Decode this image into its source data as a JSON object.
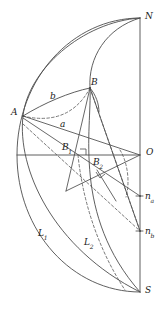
{
  "figure": {
    "type": "geometric-diagram",
    "background_color": "#ffffff",
    "stroke_color": "#4d4d4d",
    "label_color": "#1a1a1a"
  },
  "labels": {
    "north_pole": "N",
    "south_pole": "S",
    "center": "O",
    "point_a": "A",
    "point_b": "B",
    "arc_b": "b",
    "arc_a": "a",
    "angle_b1": "B",
    "angle_b1_sub": "1",
    "angle_b2": "B",
    "angle_b2_sub": "2",
    "normal_a": "n",
    "normal_a_sub": "a",
    "normal_b": "n",
    "normal_b_sub": "b",
    "curve_l1": "L",
    "curve_l1_sub": "1",
    "curve_l2": "L",
    "curve_l2_sub": "2"
  },
  "geometry": {
    "north_pole_point": [
      140,
      18
    ],
    "south_pole_point": [
      140,
      292
    ],
    "center_point": [
      140,
      155
    ],
    "point_a": [
      23,
      116
    ],
    "point_b": [
      90,
      88
    ],
    "point_b1": [
      78,
      155
    ],
    "point_b2": [
      97,
      170
    ],
    "normal_a_point": [
      140,
      196
    ],
    "normal_b_point": [
      140,
      231
    ],
    "sphere_left_extent": 17,
    "equator_y": 155
  },
  "elements": {
    "solid_curves": 5,
    "dashed_curves": 4,
    "straight_lines": 7,
    "right_angle_marks": 2
  }
}
